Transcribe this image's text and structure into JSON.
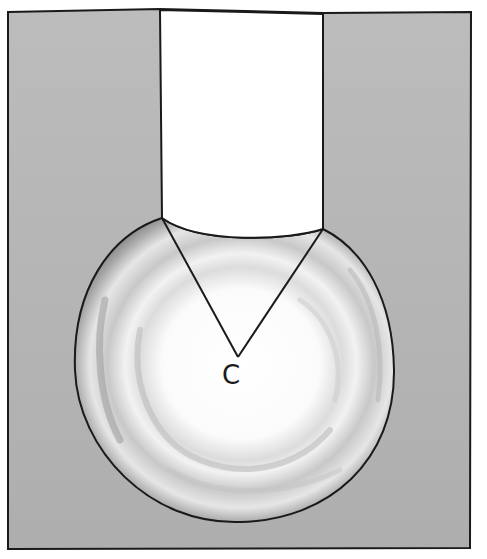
{
  "figure": {
    "type": "illustration",
    "center_label": "C",
    "colors": {
      "background_fill": "#b5b5b5",
      "outline": "#1a1a1a",
      "opening_fill": "#ffffff",
      "sphere_highlight": "#ffffff",
      "sphere_shadow": "#8a8a8a"
    }
  }
}
